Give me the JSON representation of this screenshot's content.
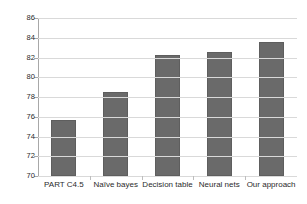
{
  "chart_data": {
    "type": "bar",
    "title": "",
    "subtitle": "",
    "xlabel": "",
    "ylabel": "",
    "categories": [
      "PART C4.5",
      "Naïve bayes",
      "Decision table",
      "Neural nets",
      "Our approach"
    ],
    "values": [
      75.7,
      78.5,
      82.3,
      82.6,
      83.6
    ],
    "ylim": [
      70,
      86
    ],
    "yticks": [
      70,
      72,
      74,
      76,
      78,
      80,
      82,
      84,
      86
    ],
    "ytick_labels": [
      "70",
      "72",
      "74",
      "76",
      "78",
      "80",
      "82",
      "84",
      "86"
    ],
    "grid": true,
    "legend": false,
    "legend_position": "none",
    "series": [
      {
        "name": "accuracy",
        "values": [
          75.7,
          78.5,
          82.3,
          82.6,
          83.6
        ],
        "color": "#6a6a6a"
      }
    ]
  },
  "colors": {
    "bar_fill": "#6a6a6a",
    "bar_stroke": "#5e5e5e",
    "grid": "#d9d9d9",
    "axis": "#a8a8a8",
    "text": "#2b2b2b",
    "background": "#ffffff"
  }
}
